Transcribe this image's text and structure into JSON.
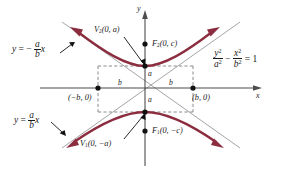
{
  "figure": {
    "type": "hyperbola-diagram",
    "colors": {
      "curve": "#8c2d3f",
      "axis": "#555555",
      "asymptote": "#888888",
      "dash_box": "#777777",
      "point": "#111111",
      "text": "#1a1a1a",
      "background": "#ffffff"
    },
    "axes": {
      "x_label": "x",
      "y_label": "y",
      "origin": {
        "x": 145,
        "y": 88
      }
    },
    "equation": {
      "numerator_left": "y",
      "denominator_left": "a",
      "numerator_right": "x",
      "denominator_right": "b",
      "power": "2",
      "minus": "−",
      "equals": "=",
      "rhs": "1"
    },
    "asymptotes": [
      {
        "name": "negative-slope-asymptote",
        "equals_prefix": "y",
        "equals": "=",
        "sign": "−",
        "numerator": "a",
        "denominator": "b",
        "variable": "x",
        "label_x": 12,
        "label_y": 46
      },
      {
        "name": "positive-slope-asymptote",
        "equals_prefix": "y",
        "equals": "=",
        "sign": "",
        "numerator": "a",
        "denominator": "b",
        "variable": "x",
        "label_x": 14,
        "label_y": 117
      }
    ],
    "points": [
      {
        "name": "vertex-upper",
        "label": "V",
        "sub": "2",
        "coords": "(0, a)",
        "x": 145,
        "y": 66
      },
      {
        "name": "focus-upper",
        "label": "F",
        "sub": "2",
        "coords": "(0, c)",
        "x": 145,
        "y": 44
      },
      {
        "name": "vertex-lower",
        "label": "V",
        "sub": "1",
        "coords": "(0, −a)",
        "x": 145,
        "y": 112
      },
      {
        "name": "focus-lower",
        "label": "F",
        "sub": "1",
        "coords": "(0, −c)",
        "x": 145,
        "y": 131
      },
      {
        "name": "box-corner-left",
        "label": "",
        "sub": "",
        "coords": "(−b, 0)",
        "x": 98,
        "y": 88
      },
      {
        "name": "box-corner-right",
        "label": "",
        "sub": "",
        "coords": "(b, 0)",
        "x": 193,
        "y": 88
      }
    ],
    "segment_labels": [
      {
        "name": "segment-a-upper",
        "text": "a",
        "x": 149,
        "y": 74
      },
      {
        "name": "segment-a-lower",
        "text": "a",
        "x": 149,
        "y": 99
      },
      {
        "name": "segment-b-left",
        "text": "b",
        "x": 119,
        "y": 82
      },
      {
        "name": "segment-b-right",
        "text": "b",
        "x": 170,
        "y": 82
      }
    ],
    "box": {
      "left": 98,
      "right": 193,
      "top": 66,
      "bottom": 112
    }
  }
}
